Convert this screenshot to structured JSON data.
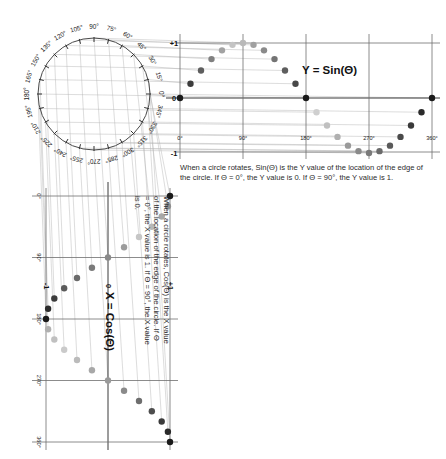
{
  "page": {
    "background": "#ffffff"
  },
  "circle": {
    "name": "unit-circle",
    "center_x": 94,
    "center_y": 94,
    "radius": 56,
    "tick_step_degrees": 15,
    "labels": [
      "0°",
      "15°",
      "30°",
      "45°",
      "60°",
      "75°",
      "90°",
      "105°",
      "120°",
      "135°",
      "150°",
      "165°",
      "180°",
      "195°",
      "210°",
      "225°",
      "240°",
      "255°",
      "270°",
      "285°",
      "300°",
      "315°",
      "330°",
      "345°"
    ],
    "stroke": "#4a4a4a"
  },
  "sin_chart": {
    "equation_label": "Y = Sin(Θ)",
    "x_tick_labels": [
      "0°",
      "90°",
      "180°",
      "270°",
      "360°"
    ],
    "y_tick_labels": [
      "+1",
      "0",
      "-1"
    ],
    "caption": "When a circle rotates, Sin(Θ) is the Y value of the location of the edge of the circle. If Θ = 0°, the Y value is 0. If Θ = 90°, the Y value is 1.",
    "axis_color": "#6f6f6f"
  },
  "cos_chart": {
    "equation_label": "X = Cos(Θ)",
    "angle_tick_labels": [
      "0°",
      "90°",
      "180°",
      "270°",
      "360°"
    ],
    "value_tick_labels": [
      "-1",
      "0",
      "+1"
    ],
    "caption": "When a circle rotates, Cos(Θ) is the X value of the location of the edge of the circle. If Θ = 0°, the X value is 1. If Θ = 90°, the X value is 0.",
    "axis_color": "#6f6f6f"
  },
  "chart_data": [
    {
      "type": "scatter",
      "name": "sine-plot",
      "title": "Y = Sin(Θ)",
      "xlabel": "Θ (degrees)",
      "ylabel": "Y",
      "xlim": [
        0,
        360
      ],
      "ylim": [
        -1,
        1
      ],
      "xticks": [
        0,
        90,
        180,
        270,
        360
      ],
      "xticklabels": [
        "0°",
        "90°",
        "180°",
        "270°",
        "360°"
      ],
      "yticks": [
        1,
        0,
        -1
      ],
      "yticklabels": [
        "+1",
        "0",
        "-1"
      ],
      "grid": true,
      "legend": false,
      "x": [
        0,
        15,
        30,
        45,
        60,
        75,
        90,
        105,
        120,
        135,
        150,
        165,
        180,
        195,
        210,
        225,
        240,
        255,
        270,
        285,
        300,
        315,
        330,
        345,
        360
      ],
      "values": [
        0.0,
        0.259,
        0.5,
        0.707,
        0.866,
        0.966,
        1.0,
        0.966,
        0.866,
        0.707,
        0.5,
        0.259,
        0.0,
        -0.259,
        -0.5,
        -0.707,
        -0.866,
        -0.966,
        -1.0,
        -0.966,
        -0.866,
        -0.707,
        -0.5,
        -0.259,
        0.0
      ],
      "point_shades": [
        "#1a1a1a",
        "#3c3c3c",
        "#5e5e5e",
        "#808080",
        "#a2a2a2",
        "#c4c4c4",
        "#b9b9b9",
        "#a0a0a0",
        "#8a8a8a",
        "#747474",
        "#5e5e5e",
        "#484848",
        "#1a1a1a",
        "#cfcfcf",
        "#c0c0c0",
        "#b0b0b0",
        "#9a9a9a",
        "#8a8a8a",
        "#7a7a7a",
        "#6a6a6a",
        "#5a5a5a",
        "#4a4a4a",
        "#3a3a3a",
        "#2a2a2a",
        "#1a1a1a"
      ]
    },
    {
      "type": "scatter",
      "name": "cosine-plot",
      "title": "X = Cos(Θ)",
      "xlabel": "Θ (degrees)",
      "ylabel": "X",
      "orientation": "vertical",
      "xlim": [
        0,
        360
      ],
      "ylim": [
        -1,
        1
      ],
      "xticks": [
        0,
        90,
        180,
        270,
        360
      ],
      "xticklabels": [
        "0°",
        "90°",
        "180°",
        "270°",
        "360°"
      ],
      "yticks": [
        -1,
        0,
        1
      ],
      "yticklabels": [
        "-1",
        "0",
        "+1"
      ],
      "grid": true,
      "legend": false,
      "x": [
        0,
        15,
        30,
        45,
        60,
        75,
        90,
        105,
        120,
        135,
        150,
        165,
        180,
        195,
        210,
        225,
        240,
        255,
        270,
        285,
        300,
        315,
        330,
        345,
        360
      ],
      "values": [
        1.0,
        0.966,
        0.866,
        0.707,
        0.5,
        0.259,
        0.0,
        -0.259,
        -0.5,
        -0.707,
        -0.866,
        -0.966,
        -1.0,
        -0.966,
        -0.866,
        -0.707,
        -0.5,
        -0.259,
        0.0,
        0.259,
        0.5,
        0.707,
        0.866,
        0.966,
        1.0
      ],
      "point_shades": [
        "#1a1a1a",
        "#8f8f8f",
        "#a8a8a8",
        "#b8b8b8",
        "#c6c6c6",
        "#9c9c9c",
        "#8a8a8a",
        "#7a7a7a",
        "#6a6a6a",
        "#5a5a5a",
        "#3c3c3c",
        "#2c2c2c",
        "#1a1a1a",
        "#b0b0b0",
        "#c0c0c0",
        "#cacaca",
        "#bbbbbb",
        "#a8a8a8",
        "#9a9a9a",
        "#8a8a8a",
        "#6e6e6e",
        "#4e4e4e",
        "#3a3a3a",
        "#2a2a2a",
        "#1a1a1a"
      ]
    }
  ],
  "projection_lines": {
    "name": "projection-guides",
    "horizontal_color": "#b4b4b4",
    "vertical_color": "#b4b4b4"
  }
}
